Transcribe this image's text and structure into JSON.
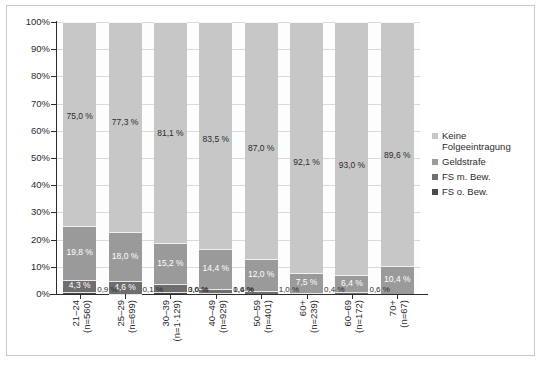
{
  "chart_data": {
    "type": "bar",
    "subtype": "stacked-percentage",
    "title": "",
    "xlabel": "",
    "ylabel": "",
    "ylim": [
      0,
      100
    ],
    "grid": true,
    "legend_position": "right",
    "y_ticks": [
      "0%",
      "10%",
      "20%",
      "30%",
      "40%",
      "50%",
      "60%",
      "70%",
      "80%",
      "90%",
      "100%"
    ],
    "categories": [
      "21–24",
      "25–29",
      "30–39",
      "40–49",
      "50–59",
      "60+",
      "60–69",
      "70+"
    ],
    "category_sublabels": [
      "(n=560)",
      "(n=699)",
      "(n=1·129)",
      "(n=929)",
      "(n=401)",
      "(n=239)",
      "(n=172)",
      "(n=67)"
    ],
    "series": [
      {
        "name": "Keine Folgeeintragung",
        "color": "#c7c7c7",
        "values": [
          75.0,
          77.3,
          81.1,
          83.5,
          87.0,
          92.1,
          93.0,
          89.6
        ],
        "labels": [
          "75,0 %",
          "77,3 %",
          "81,1 %",
          "83,5 %",
          "87,0 %",
          "92,1 %",
          "93,0 %",
          "89,6 %"
        ]
      },
      {
        "name": "Geldstrafe",
        "color": "#9a9a9a",
        "values": [
          19.8,
          18.0,
          15.2,
          14.4,
          12.0,
          7.5,
          6.4,
          10.4
        ],
        "labels": [
          "19,8 %",
          "18,0 %",
          "15,2 %",
          "14,4 %",
          "12,0 %",
          "7,5 %",
          "6,4 %",
          "10,4 %"
        ]
      },
      {
        "name": "FS m. Bew.",
        "color": "#6e6e6e",
        "values": [
          4.3,
          4.6,
          3.0,
          1.6,
          1.0,
          0.4,
          0.6,
          0.0
        ],
        "labels": [
          "4,3 %",
          "4,6 %",
          "3,0 %",
          "1,6 %",
          "1,0 %",
          "0,4 %",
          "0,6 %",
          ""
        ]
      },
      {
        "name": "FS o. Bew.",
        "color": "#4a4a4a",
        "values": [
          0.9,
          0.1,
          0.6,
          0.4,
          0.0,
          0.0,
          0.0,
          0.0
        ],
        "labels": [
          "0,9 %",
          "0,1 %",
          "0,6 %",
          "0,4 %",
          "",
          "",
          "",
          ""
        ]
      }
    ]
  },
  "legend": {
    "items": [
      {
        "label": "Keine Folgeeintragung",
        "color": "#c7c7c7"
      },
      {
        "label": "Geldstrafe",
        "color": "#9a9a9a"
      },
      {
        "label": "FS m. Bew.",
        "color": "#6e6e6e"
      },
      {
        "label": "FS o. Bew.",
        "color": "#4a4a4a"
      }
    ]
  }
}
